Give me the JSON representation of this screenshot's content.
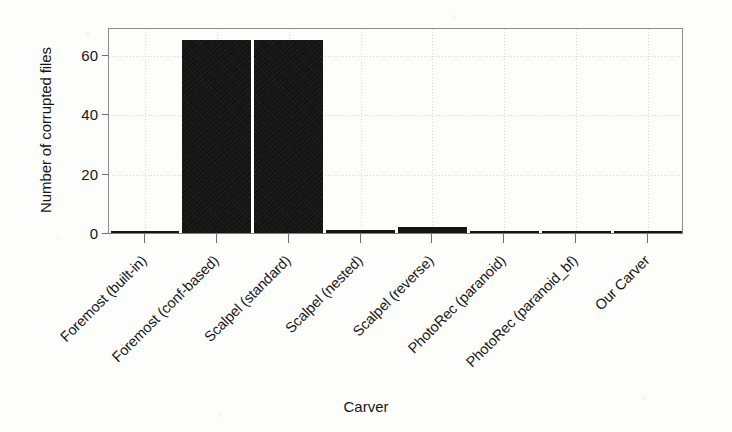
{
  "chart_data": {
    "type": "bar",
    "title": "",
    "xlabel": "Carver",
    "ylabel": "Number of corrupted files",
    "categories": [
      "Foremost (built-in)",
      "Foremost (conf-based)",
      "Scalpel (standard)",
      "Scalpel (nested)",
      "Scalpel (reverse)",
      "PhotoRec (paranoid)",
      "PhotoRec (paranoid_bf)",
      "Our Carver"
    ],
    "values": [
      0,
      65,
      65,
      1,
      2,
      0,
      0,
      0
    ],
    "ylim": [
      0,
      67
    ],
    "yticks": [
      0,
      20,
      40,
      60
    ],
    "ytick_labels": [
      "0",
      "20",
      "40",
      "60"
    ],
    "grid": true,
    "grid_style": "dotted",
    "legend": "none",
    "bar_color": "#121212",
    "axis_color": "#8d8d8d",
    "x_tick_rotation": -45
  },
  "axis": {
    "y_title": "Number of corrupted files",
    "x_title": "Carver"
  }
}
